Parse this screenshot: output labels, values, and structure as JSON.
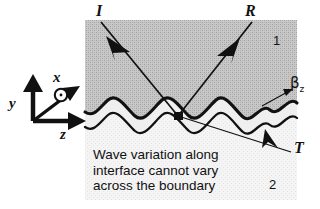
{
  "figure": {
    "regions": {
      "upper": {
        "label": "1",
        "fill": "#b9b9b9"
      },
      "lower": {
        "label": "2",
        "fill": "#f1f1f1"
      }
    },
    "rays": [
      {
        "name": "incident",
        "label": "I"
      },
      {
        "name": "reflected",
        "label": "R"
      },
      {
        "name": "transmitted",
        "label": "T"
      }
    ],
    "axes": [
      {
        "name": "y-axis",
        "label": "y"
      },
      {
        "name": "x-axis",
        "label": "x"
      },
      {
        "name": "z-axis",
        "label": "z"
      }
    ],
    "annotations": [
      {
        "name": "propagation-constant",
        "label": "β",
        "subscript": "z"
      }
    ],
    "caption_lines": [
      "Wave variation along",
      "interface cannot vary",
      "across the boundary"
    ],
    "colors": {
      "ink": "#111111",
      "upper_region": "#b9b9b9",
      "lower_region": "#f1f1f1",
      "page": "#ffffff"
    }
  }
}
